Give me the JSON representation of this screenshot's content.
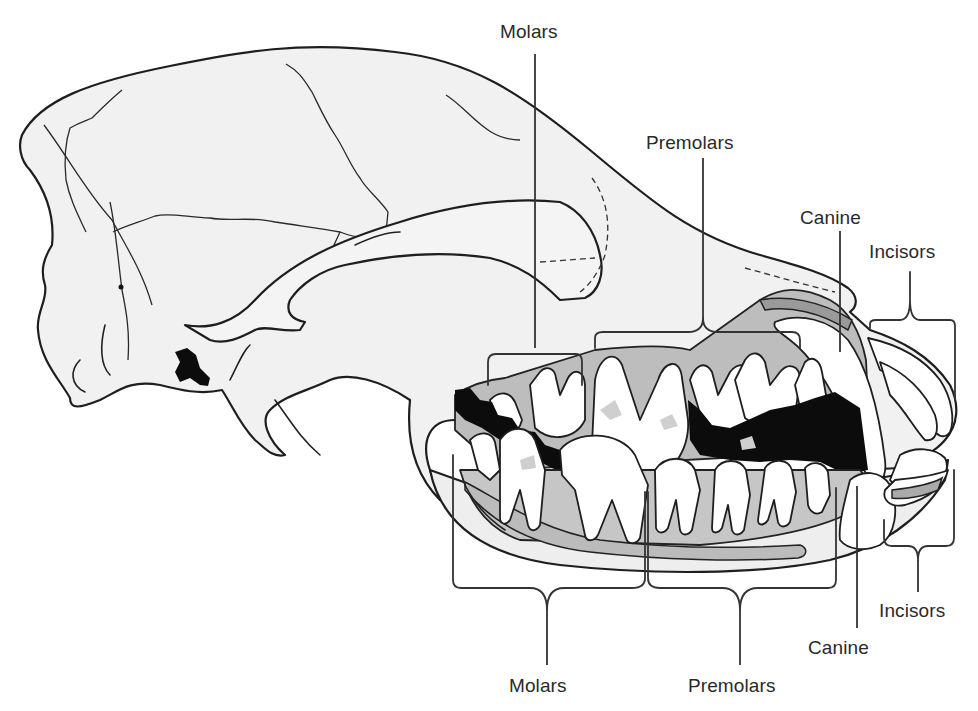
{
  "figure": {
    "colors": {
      "bone_fill": "#f1f1f1",
      "gum_fill": "#bdbdbd",
      "tooth_fill": "#ffffff",
      "outline": "#1e1e1e",
      "dark_fill": "#0c0c0c",
      "label_text": "#2a2a2a"
    }
  },
  "labels": {
    "upper": {
      "molars": "Molars",
      "premolars": "Premolars",
      "canine": "Canine",
      "incisors": "Incisors"
    },
    "lower": {
      "molars": "Molars",
      "premolars": "Premolars",
      "canine": "Canine",
      "incisors": "Incisors"
    }
  }
}
